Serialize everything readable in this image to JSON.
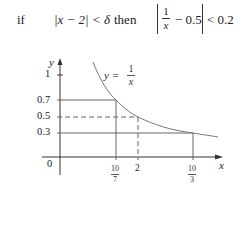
{
  "formula": {
    "if": "if",
    "condition": "|x − 2| < δ",
    "then": "then",
    "frac_num": "1",
    "frac_den": "x",
    "rhs": "− 0.5",
    "inequality": "< 0.2"
  },
  "graph": {
    "y_axis_label": "y",
    "x_axis_label": "x",
    "origin_label": "0",
    "curve_label_prefix": "y =",
    "curve_label_num": "1",
    "curve_label_den": "x",
    "y_ticks": [
      {
        "label": "1",
        "value": 1
      },
      {
        "label": "0.7",
        "value": 0.7
      },
      {
        "label": "0.5",
        "value": 0.5
      },
      {
        "label": "0.3",
        "value": 0.3
      }
    ],
    "x_ticks": [
      {
        "num": "10",
        "den": "7",
        "value": 1.4286
      },
      {
        "label": "2",
        "value": 2
      },
      {
        "num": "10",
        "den": "3",
        "value": 3.3333
      }
    ],
    "colors": {
      "axis": "#333333",
      "curve": "#777777",
      "guides": "#555555"
    }
  }
}
